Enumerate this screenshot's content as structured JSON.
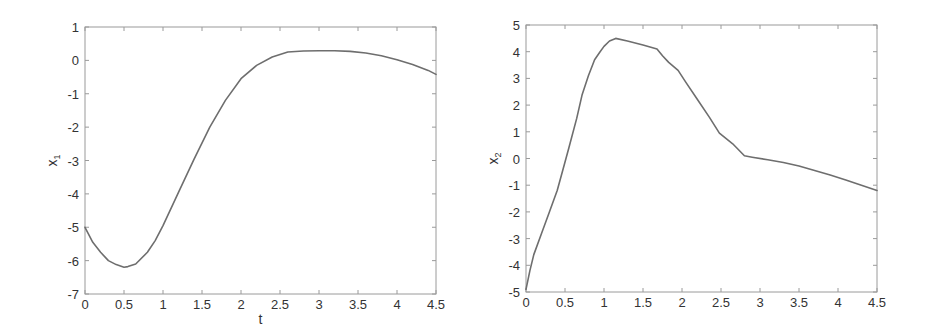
{
  "chart_data": [
    {
      "type": "line",
      "title": "",
      "xlabel": "t",
      "ylabel": "x1",
      "ylabel_main": "x",
      "ylabel_sub": "1",
      "xlim": [
        0,
        4.5
      ],
      "ylim": [
        -7,
        1
      ],
      "grid": false,
      "xticks": [
        0,
        0.5,
        1,
        1.5,
        2,
        2.5,
        3,
        3.5,
        4,
        4.5
      ],
      "xtick_labels": [
        "0",
        "0.5",
        "1",
        "1.5",
        "2",
        "2.5",
        "3",
        "3.5",
        "4",
        "4.5"
      ],
      "yticks": [
        1,
        0,
        -1,
        -2,
        -3,
        -4,
        -5,
        -6,
        -7
      ],
      "ytick_labels": [
        "1",
        "0",
        "-1",
        "-2",
        "-3",
        "-4",
        "-5",
        "-6",
        "-7"
      ],
      "frame": {
        "left": 85,
        "top": 27,
        "right": 436,
        "bottom": 294
      },
      "series": [
        {
          "name": "x1",
          "x": [
            0,
            0.1,
            0.2,
            0.3,
            0.4,
            0.5,
            0.55,
            0.65,
            0.8,
            0.9,
            1.0,
            1.2,
            1.4,
            1.6,
            1.8,
            2.0,
            2.2,
            2.4,
            2.6,
            2.8,
            3.0,
            3.2,
            3.4,
            3.6,
            3.8,
            4.0,
            4.2,
            4.4,
            4.5
          ],
          "y": [
            -5.0,
            -5.45,
            -5.75,
            -6.0,
            -6.12,
            -6.2,
            -6.18,
            -6.1,
            -5.75,
            -5.4,
            -4.95,
            -3.95,
            -2.95,
            -2.0,
            -1.2,
            -0.55,
            -0.15,
            0.1,
            0.25,
            0.28,
            0.29,
            0.29,
            0.27,
            0.22,
            0.14,
            0.02,
            -0.12,
            -0.3,
            -0.42
          ]
        }
      ]
    },
    {
      "type": "line",
      "title": "",
      "xlabel": "",
      "ylabel": "x2",
      "ylabel_main": "x",
      "ylabel_sub": "2",
      "xlim": [
        0,
        4.5
      ],
      "ylim": [
        -5,
        5
      ],
      "grid": false,
      "xticks": [
        0,
        0.5,
        1,
        1.5,
        2,
        2.5,
        3,
        3.5,
        4,
        4.5
      ],
      "xtick_labels": [
        "0",
        "0.5",
        "1",
        "1.5",
        "2",
        "2.5",
        "3",
        "3.5",
        "4",
        "4.5"
      ],
      "yticks": [
        5,
        4,
        3,
        2,
        1,
        0,
        -1,
        -2,
        -3,
        -4,
        -5
      ],
      "ytick_labels": [
        "5",
        "4",
        "3",
        "2",
        "1",
        "0",
        "-1",
        "-2",
        "-3",
        "-4",
        "-5"
      ],
      "frame": {
        "left": 526,
        "top": 25,
        "right": 877,
        "bottom": 292
      },
      "series": [
        {
          "name": "x2",
          "x": [
            0,
            0.05,
            0.1,
            0.2,
            0.3,
            0.4,
            0.47,
            0.55,
            0.65,
            0.72,
            0.8,
            0.88,
            0.95,
            1.0,
            1.07,
            1.15,
            1.3,
            1.5,
            1.68,
            1.75,
            1.83,
            1.95,
            2.05,
            2.2,
            2.35,
            2.48,
            2.65,
            2.8,
            2.9,
            3.1,
            3.3,
            3.5,
            3.7,
            3.9,
            4.1,
            4.3,
            4.5
          ],
          "y": [
            -4.9,
            -4.2,
            -3.6,
            -2.8,
            -2.0,
            -1.2,
            -0.45,
            0.4,
            1.5,
            2.4,
            3.1,
            3.7,
            4.0,
            4.2,
            4.4,
            4.5,
            4.4,
            4.25,
            4.1,
            3.85,
            3.6,
            3.3,
            2.85,
            2.2,
            1.55,
            0.95,
            0.55,
            0.1,
            0.05,
            -0.05,
            -0.15,
            -0.28,
            -0.45,
            -0.62,
            -0.8,
            -1.0,
            -1.2
          ]
        }
      ]
    }
  ]
}
